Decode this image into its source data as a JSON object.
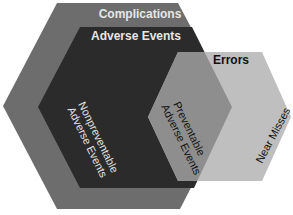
{
  "diagram": {
    "type": "nested-hexagon-venn",
    "colors": {
      "complications": "#6d6d6d",
      "adverse_events": "#2b2b2b",
      "errors": "#bfbfbf",
      "preventable_overlap": "#8e8e8e",
      "text_light": "#e6e6e6",
      "text_dark": "#111111"
    },
    "regions": {
      "complications": {
        "label": "Complications"
      },
      "adverse_events": {
        "label": "Adverse Events"
      },
      "errors": {
        "label": "Errors"
      },
      "nonpreventable": {
        "line1": "Nonpreventable",
        "line2": "Adverse Events"
      },
      "preventable": {
        "line1": "Preventable",
        "line2": "Adverse Events"
      },
      "near_misses": {
        "label": "Near Misses"
      }
    }
  }
}
